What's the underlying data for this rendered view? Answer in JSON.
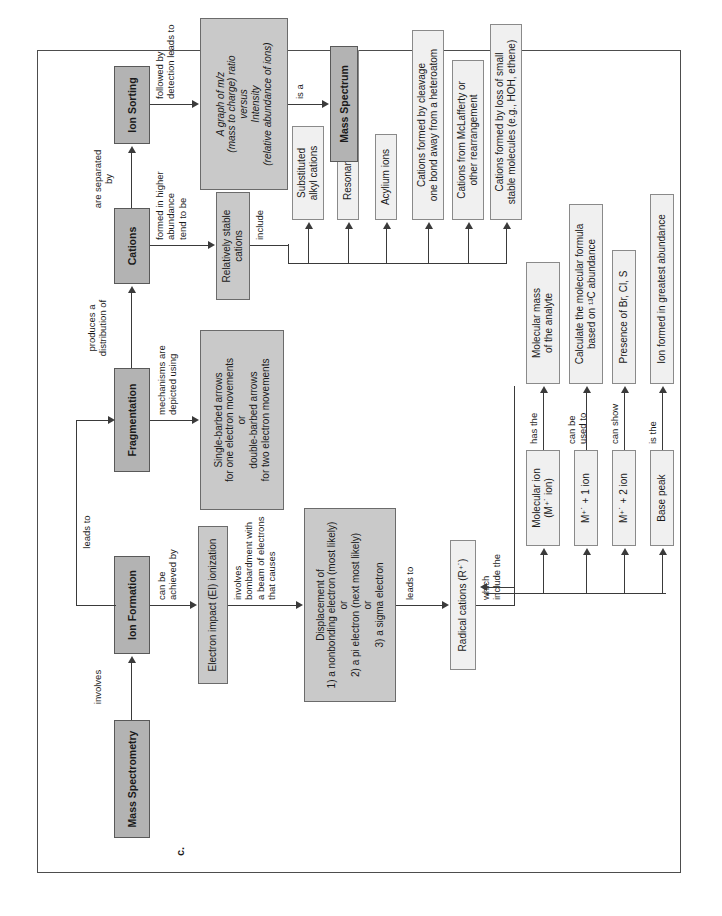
{
  "page": {
    "header_bar_label": "CONCEPT MAP",
    "figure_letter": "c.",
    "bar_color": "#6e6e6e",
    "main_node_color": "#b3b3b3",
    "detail_node_color": "#c9c9c9",
    "light_node_color": "#f0f0f0"
  },
  "nodes": {
    "mass_spectrometry": "Mass Spectrometry",
    "ion_formation": "Ion Formation",
    "fragmentation": "Fragmentation",
    "cations": "Cations",
    "ion_sorting": "Ion Sorting",
    "mass_spectrum": "Mass Spectrum",
    "ei_ionization": "Electron impact (EI) ionization",
    "displacement": "Displacement of\n1) a nonbonding electron (most likely)\nor\n2) a pi electron (next most likely)\nor\n3) a sigma electron",
    "radical_cations": "Radical cations (R⁺˙)",
    "arrows_box": "Single-barbed arrows\nfor one electron movements\nor\ndouble-barbed arrows\nfor two electron movements",
    "graph_box": "A graph of m/z\n(mass to charge) ratio\nversus\nIntensity\n(relative abundance of ions)",
    "relatively_stable_cations": "Relatively stable\ncations",
    "molecular_ion": "Molecular ion\n(M⁺˙ ion)",
    "m_plus_1": "M⁺˙ + 1 ion",
    "m_plus_2": "M⁺˙ + 2 ion",
    "base_peak": "Base peak",
    "molecular_mass": "Molecular mass\nof the analyte",
    "calculate_formula": "Calculate the molecular formula\nbased on ¹³C abundance",
    "presence_halogens": "Presence of Br, Cl, S",
    "greatest_abundance": "Ion formed in greatest abundance",
    "substituted_alkyl": "Substituted\nalkyl cations",
    "resonance_stabilized": "Resonance-stabilized cations",
    "acylium": "Acylium ions",
    "cleavage_heteroatom": "Cations formed by cleavage\none bond away from a heteroatom",
    "mclafferty": "Cations from McLafferty or\nother rearrangement",
    "loss_small_molecules": "Cations formed by loss of small\nstable molecules (e.g., HOH, ethene)"
  },
  "connectors": {
    "involves": "involves",
    "can_be_achieved_by": "can be\nachieved by",
    "involves_bombardment": "involves\nbombardment with\na beam of electrons\nthat causes",
    "leads_to_radical": "leads to",
    "which_include_the": "which\ninclude the",
    "leads_to_fragmentation": "leads to",
    "mechanisms_depicted": "mechanisms are\ndepicted using",
    "produces_distribution": "produces a\ndistribution of",
    "are_separated_by": "are separated by",
    "formed_higher_abundance": "formed in higher\nabundance\ntend to be",
    "include": "include",
    "followed_by_detection": "followed by\ndetection leads to",
    "is_a": "is a",
    "has_the": "has the",
    "can_be_used_to": "can be\nused to",
    "can_show": "can show",
    "is_the": "is the"
  }
}
